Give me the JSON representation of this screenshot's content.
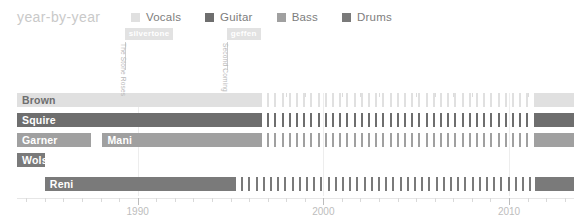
{
  "header": {
    "title": "year-by-year"
  },
  "legend": {
    "items": [
      {
        "label": "Vocals",
        "color": "#e0e0e0"
      },
      {
        "label": "Guitar",
        "color": "#6e6e6e"
      },
      {
        "label": "Bass",
        "color": "#a0a0a0"
      },
      {
        "label": "Drums",
        "color": "#7a7a7a"
      }
    ]
  },
  "annotations": [
    {
      "tag": "silvertone",
      "release": "The Stone Roses",
      "year": 1989.3
    },
    {
      "tag": "geffen",
      "release": "Second Coming",
      "year": 1994.8
    }
  ],
  "colors": {
    "vocals": "#e0e0e0",
    "guitar": "#6e6e6e",
    "bass": "#a0a0a0",
    "drums": "#7a7a7a",
    "grid": "#ededed",
    "tag_bg": "#e2e2e2",
    "title": "#c9c9c9",
    "axis_text": "#bdbdbd"
  },
  "chart_data": {
    "type": "bar",
    "title": "year-by-year",
    "xlabel": "",
    "ylabel": "",
    "xlim": [
      1983.5,
      2013.5
    ],
    "ticks": [
      1990,
      2000,
      2010
    ],
    "tick_labels": [
      "1990",
      "2000",
      "2010"
    ],
    "grid": true,
    "legend_position": "top",
    "minor_tick_step": 1,
    "members": [
      {
        "name": "Brown",
        "role": "Vocals",
        "color": "#e0e0e0",
        "label_color": "dark",
        "segments": [
          {
            "label": "Brown",
            "start": 1983.5,
            "end": 1996.6,
            "style": "solid"
          },
          {
            "start": 1996.6,
            "end": 2011.4,
            "style": "dashed"
          },
          {
            "start": 2011.4,
            "end": 2013.5,
            "style": "solid"
          }
        ]
      },
      {
        "name": "Squire",
        "role": "Guitar",
        "color": "#6e6e6e",
        "label_color": "light",
        "segments": [
          {
            "label": "Squire",
            "start": 1983.5,
            "end": 1996.6,
            "style": "solid"
          },
          {
            "start": 1996.6,
            "end": 2011.4,
            "style": "dashed"
          },
          {
            "start": 2011.4,
            "end": 2013.5,
            "style": "solid"
          }
        ]
      },
      {
        "name": "Garner",
        "role": "Bass",
        "color": "#a0a0a0",
        "label_color": "light",
        "segments": [
          {
            "label": "Garner",
            "start": 1983.5,
            "end": 1987.5,
            "style": "solid"
          },
          {
            "label": "Mani",
            "start": 1988.1,
            "end": 1996.6,
            "style": "solid"
          },
          {
            "start": 1996.6,
            "end": 2011.4,
            "style": "dashed"
          },
          {
            "start": 2011.4,
            "end": 2013.5,
            "style": "solid"
          }
        ]
      },
      {
        "name": "Wolstencroft",
        "role": "Drums",
        "color": "#7a7a7a",
        "label_color": "light",
        "segments": [
          {
            "label": "Wolstencroft",
            "start": 1983.5,
            "end": 1985.0,
            "style": "solid"
          }
        ]
      },
      {
        "name": "Reni",
        "role": "Drums",
        "color": "#7a7a7a",
        "label_color": "light",
        "segments": [
          {
            "label": "Reni",
            "start": 1985.0,
            "end": 1995.2,
            "style": "solid"
          },
          {
            "start": 1995.2,
            "end": 2011.4,
            "style": "dashed"
          },
          {
            "start": 2011.4,
            "end": 2013.5,
            "style": "solid"
          }
        ]
      }
    ],
    "row_geometry": [
      {
        "top": 0,
        "height": 14
      },
      {
        "top": 20,
        "height": 14
      },
      {
        "top": 40,
        "height": 14
      },
      {
        "top": 60,
        "height": 14
      },
      {
        "top": 84,
        "height": 14
      }
    ]
  }
}
